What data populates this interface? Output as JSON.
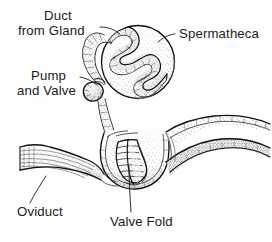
{
  "figure": {
    "style": "black-and-white stippled line drawing",
    "background_color": "#fefefe",
    "ink_color": "#111111",
    "label_color": "#1a1a1a"
  },
  "labels": [
    {
      "id": "duct-from-gland",
      "line1": "Duct",
      "line2": "from Gland",
      "text": "Duct from Gland",
      "align": "left",
      "x": 31,
      "y": 20,
      "leader": "from text right edge down-right to the duct entering the spermatheca"
    },
    {
      "id": "spermatheca",
      "line1": "Spermatheca",
      "line2": "",
      "text": "Spermatheca",
      "align": "left",
      "x": 178,
      "y": 38,
      "leader": "from text left edge down-left to the upper-right of the spherical capsule"
    },
    {
      "id": "pump-and-valve",
      "line1": "Pump",
      "line2": "and Valve",
      "text": "Pump and Valve",
      "align": "left",
      "x": 28,
      "y": 75,
      "leader": "from text right edge to the small bulbous pump on the duct"
    },
    {
      "id": "oviduct",
      "line1": "Oviduct",
      "line2": "",
      "text": "Oviduct",
      "align": "left",
      "x": 18,
      "y": 213,
      "leader": "from text up-right to the tapering tube at lower left"
    },
    {
      "id": "valve-fold",
      "line1": "Valve Fold",
      "line2": "",
      "text": "Valve Fold",
      "align": "left",
      "x": 112,
      "y": 223,
      "leader": "from text up into the scalloped cells of the valve fold"
    }
  ],
  "structures": [
    {
      "id": "spermatheca-capsule",
      "name": "Spermatheca",
      "description": "large stippled sphere, upper right of figure"
    },
    {
      "id": "internal-coil",
      "name": "Spermathecal duct coil",
      "description": "serpentine zig-zag duct coiled inside the capsule"
    },
    {
      "id": "gland-duct",
      "name": "Duct from Gland",
      "description": "tube curving over the top-left of the capsule"
    },
    {
      "id": "pump-bulb",
      "name": "Pump and Valve",
      "description": "small bulbous swelling on the duct at the capsule's lower left"
    },
    {
      "id": "spermathecal-stalk",
      "name": "Spermathecal stalk",
      "description": "narrow duct running down from the pump to the genital chamber"
    },
    {
      "id": "oviduct-tube",
      "name": "Oviduct",
      "description": "flared tube entering from the left with longitudinal striations"
    },
    {
      "id": "genital-chamber",
      "name": "Genital chamber / bursa",
      "description": "stippled pouch in the centre-bottom of the figure"
    },
    {
      "id": "valve-fold-cells",
      "name": "Valve Fold",
      "description": "U-shaped fold with scalloped segmented cells"
    },
    {
      "id": "vaginal-wall",
      "name": "Vaginal wall",
      "description": "stippled band sweeping away to the right"
    }
  ]
}
